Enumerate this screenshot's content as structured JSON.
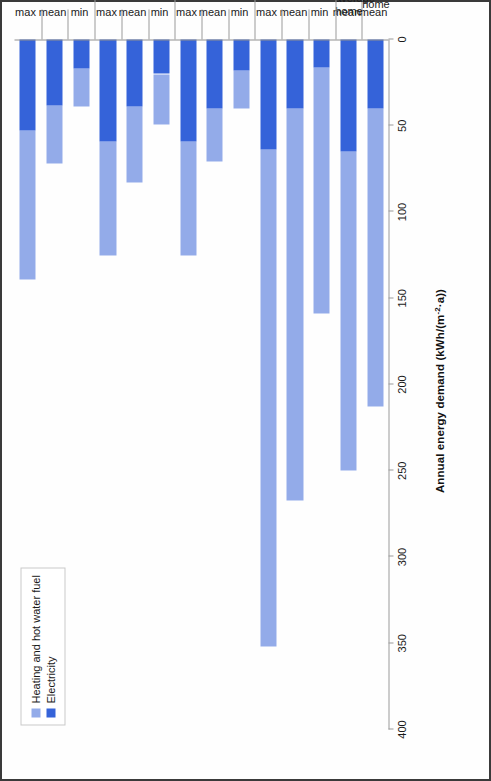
{
  "chart_data": {
    "type": "bar",
    "orientation": "horizontal-stacked",
    "title": "",
    "xlabel": "Annual energy demand (kWh/(m⁻²·a))",
    "ylabel": "Dwelling type",
    "xlim": [
      0,
      400
    ],
    "xticks": [
      0,
      50,
      100,
      150,
      200,
      250,
      300,
      350,
      400
    ],
    "grid": false,
    "legend_position": "top-left",
    "categories": [
      "UK average home — mean",
      "Local authority average home — mean",
      "Pre-move-in (conventional UK homes) — min",
      "Pre-move-in (conventional UK homes) — mean",
      "Pre-move-in (conventional UK homes) — max",
      "Post-move-in year 1 (Passivhaus UK homes) — min",
      "Post-move-in year 1 (Passivhaus UK homes) — mean",
      "Post-move-in year 1 (Passivhaus UK homes) — max",
      "Post-move-in year 2 (Passivhaus UK homes) — min",
      "Post-move-in year 2 (Passivhaus UK homes) — mean",
      "Post-move-in year 2 (Passivhaus UK homes) — max",
      "Post-move-in year 3 (Passivhaus UK homes) — min",
      "Post-move-in year 3 (Passivhaus UK homes) — mean",
      "Post-move-in year 3 (Passivhaus UK homes) — max"
    ],
    "series": [
      {
        "name": "Heating and hot water fuel",
        "color": "#93abe9",
        "values": [
          173,
          185,
          143,
          227,
          288,
          22,
          31,
          66,
          29,
          44,
          66,
          22,
          34,
          86
        ]
      },
      {
        "name": "Electricity",
        "color": "#3563d9",
        "values": [
          40,
          65,
          16,
          40,
          64,
          18,
          40,
          59,
          20,
          39,
          59,
          17,
          38,
          53
        ]
      }
    ],
    "totals": [
      213,
      250,
      159,
      267,
      352,
      40,
      71,
      125,
      49,
      83,
      125,
      39,
      72,
      139
    ]
  },
  "legend": {
    "items": [
      {
        "label": "Heating and hot water fuel",
        "color": "#93abe9"
      },
      {
        "label": "Electricity",
        "color": "#3563d9"
      }
    ]
  },
  "axes": {
    "value_axis_title": "Annual energy demand (kWh/(m⁻²·a))",
    "value_axis_title_main": "Annual energy demand (kWh/(m",
    "value_axis_title_sup": "-2",
    "value_axis_title_tail": "·a))",
    "category_axis_title": "Dwelling type",
    "tick_labels": [
      "0",
      "50",
      "100",
      "150",
      "200",
      "250",
      "300",
      "350",
      "400"
    ]
  },
  "groups": [
    {
      "name": "UK average\nhome",
      "stats": [
        "mean"
      ]
    },
    {
      "name": "Local authority\naverage\nhome",
      "stats": [
        "mean"
      ]
    },
    {
      "name": "Pre-move-in\n(conventional UK homes)",
      "stats": [
        "min",
        "mean",
        "max"
      ]
    },
    {
      "name": "Post-move-in year 1\n(Passivhaus UK homes)",
      "stats": [
        "min",
        "mean",
        "max"
      ]
    },
    {
      "name": "Post-move-in year 2\n(Passivhaus UK homes)",
      "stats": [
        "min",
        "mean",
        "max"
      ]
    },
    {
      "name": "Post-move-in year 3\n(Passivhaus UK homes)",
      "stats": [
        "min",
        "mean",
        "max"
      ]
    }
  ]
}
